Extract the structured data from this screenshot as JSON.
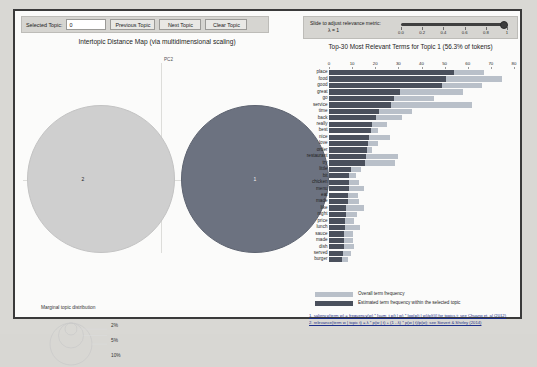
{
  "app": {
    "name": "pyLDAvis",
    "colors": {
      "selected_topic": "#6c7280",
      "other_topic": "#cfcfcf",
      "bar_overall": "#b9c0c9",
      "bar_topic": "#4a505c",
      "panel_bg": "#fbfbfa",
      "page_bg": "#d9d8d4",
      "control_bg": "#d6d5d1",
      "link": "#1b2f8a"
    }
  },
  "topic_controls": {
    "selected_topic_label": "Selected Topic:",
    "selected_topic_value": "0",
    "previous_topic_label": "Previous Topic",
    "next_topic_label": "Next Topic",
    "clear_topic_label": "Clear Topic"
  },
  "lambda_controls": {
    "slider_label": "Slide to adjust relevance metric:",
    "lambda_label": "λ = 1",
    "lambda_value": 1,
    "ticks": [
      "0.0",
      "0.2",
      "0.4",
      "0.6",
      "0.8",
      "1"
    ]
  },
  "left_panel": {
    "title": "Intertopic Distance Map (via multidimensional scaling)",
    "x_axis_label": "PC1",
    "y_axis_label": "PC2",
    "topics": [
      {
        "id": "2",
        "label": "2",
        "x": 80,
        "y": 132,
        "r": 74,
        "selected": false
      },
      {
        "id": "1",
        "label": "1",
        "x": 234,
        "y": 132,
        "r": 74,
        "selected": true
      }
    ],
    "marginal_legend": {
      "title": "Marginal topic distribution",
      "sizes": [
        "2%",
        "5%",
        "10%"
      ]
    }
  },
  "right_panel": {
    "title": "Top-30 Most Relevant Terms for Topic 1 (56.3% of tokens)",
    "legend": {
      "overall_label": "Overall term frequency",
      "topic_label": "Estimated term frequency within the selected topic"
    },
    "footnotes": [
      "1. saliency(term w) = frequency(w) * [sum_t p(t | w) * log(p(t | w)/p(t))] for topics t; see Chuang et. al (2012)",
      "2. relevance(term w | topic t) = λ * p(w | t) + (1 - λ) * p(w | t)/p(w); see Sievert & Shirley (2014)"
    ]
  },
  "chart_data": {
    "type": "bar",
    "orientation": "horizontal",
    "stacked": true,
    "title": "Top-30 Most Relevant Terms for Topic 1 (56.3% of tokens)",
    "xlabel": "",
    "ylabel": "",
    "xlim": [
      0,
      80
    ],
    "xticks": [
      0,
      10,
      20,
      30,
      40,
      50,
      60,
      70,
      80
    ],
    "grid": false,
    "legend_position": "bottom",
    "categories": [
      "place",
      "food",
      "good",
      "great",
      "go",
      "service",
      "time",
      "back",
      "really",
      "best",
      "nice",
      "love",
      "order",
      "restaurant",
      "try",
      "little",
      "bit",
      "chicken",
      "menu",
      "eat",
      "made",
      "like",
      "night",
      "price",
      "lunch",
      "sauce",
      "made",
      "dish",
      "served",
      "burger"
    ],
    "series": [
      {
        "name": "Overall term frequency",
        "values": [
          67.0,
          75.0,
          66.0,
          58.0,
          45.5,
          62.0,
          36.0,
          31.5,
          25.0,
          21.0,
          26.5,
          21.0,
          18.5,
          30.0,
          28.5,
          14.0,
          11.5,
          13.0,
          15.0,
          12.5,
          13.0,
          15.0,
          12.0,
          11.0,
          13.5,
          10.5,
          10.5,
          11.0,
          9.5,
          8.0
        ]
      },
      {
        "name": "Estimated term frequency within the selected topic",
        "values": [
          54.0,
          50.5,
          49.0,
          30.5,
          28.0,
          27.0,
          21.5,
          20.5,
          18.5,
          18.0,
          17.5,
          17.0,
          16.5,
          16.0,
          15.5,
          9.5,
          8.5,
          8.5,
          8.5,
          8.0,
          8.0,
          7.5,
          7.5,
          7.0,
          7.0,
          6.5,
          6.5,
          6.5,
          6.0,
          5.5
        ]
      }
    ]
  }
}
